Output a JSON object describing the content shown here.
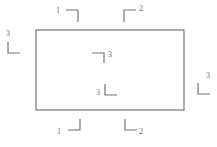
{
  "figure": {
    "background_color": "#ffffff",
    "stroke_color": "#737373",
    "label_color": "#6b6b6b",
    "stroke_width": 1.2,
    "rectangle": {
      "x": 36,
      "y": 30,
      "width": 148,
      "height": 80
    },
    "markers": [
      {
        "id": "top-left-outer",
        "label": "1",
        "orientation": "opening-down-left",
        "corner_x": 78,
        "corner_y": 10,
        "arm_h": 12,
        "arm_v": 12,
        "label_x": 56,
        "label_y": 7
      },
      {
        "id": "top-right-outer",
        "label": "2",
        "orientation": "opening-down-right",
        "corner_x": 124,
        "corner_y": 10,
        "arm_h": 12,
        "arm_v": 12,
        "label_x": 139,
        "label_y": 5
      },
      {
        "id": "left-outer",
        "label": "3",
        "orientation": "opening-up-right",
        "corner_x": 8,
        "corner_y": 53,
        "arm_h": 12,
        "arm_v": 11,
        "label_x": 6,
        "label_y": 30
      },
      {
        "id": "right-outer",
        "label": "3",
        "orientation": "opening-up-right",
        "corner_x": 198,
        "corner_y": 94,
        "arm_h": 12,
        "arm_v": 11,
        "label_x": 206,
        "label_y": 72
      },
      {
        "id": "interior-upper",
        "label": "3",
        "orientation": "opening-down-left",
        "corner_x": 104,
        "corner_y": 53,
        "arm_h": 12,
        "arm_v": 10,
        "label_x": 108,
        "label_y": 51
      },
      {
        "id": "interior-lower",
        "label": "3",
        "orientation": "opening-up-right",
        "corner_x": 105,
        "corner_y": 95,
        "arm_h": 12,
        "arm_v": 11,
        "label_x": 96,
        "label_y": 89
      },
      {
        "id": "bottom-left-outer",
        "label": "1",
        "orientation": "opening-up-left",
        "corner_x": 80,
        "corner_y": 130,
        "arm_h": 12,
        "arm_v": 11,
        "label_x": 57,
        "label_y": 128
      },
      {
        "id": "bottom-right-outer",
        "label": "2",
        "orientation": "opening-up-right",
        "corner_x": 125,
        "corner_y": 130,
        "arm_h": 12,
        "arm_v": 11,
        "label_x": 139,
        "label_y": 128
      }
    ]
  }
}
